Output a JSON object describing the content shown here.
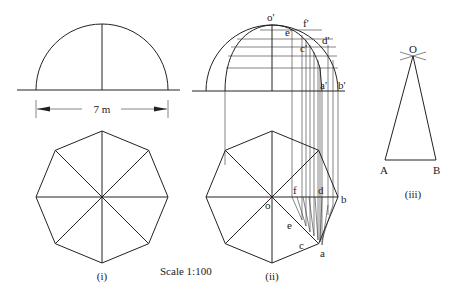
{
  "figures": [
    {
      "id": "i",
      "caption": "(i)",
      "dimension": "7 m",
      "description": "Elevation (semicircle) and plan (regular octagon) of hemispherical dome"
    },
    {
      "id": "ii",
      "caption": "(ii)",
      "elevation_labels": [
        "o'",
        "e'",
        "f'",
        "c'",
        "d'",
        "a'",
        "b'"
      ],
      "plan_labels": [
        "o",
        "f",
        "d",
        "b",
        "e",
        "c",
        "a"
      ]
    },
    {
      "id": "iii",
      "caption": "(iii)",
      "apex_label": "O",
      "base_labels": [
        "A",
        "B"
      ]
    }
  ],
  "scale_text": "Scale 1:100",
  "labels": {
    "dim": "7 m",
    "cap_i": "(i)",
    "cap_ii": "(ii)",
    "cap_iii": "(iii)",
    "scale": "Scale 1:100",
    "o_p": "o'",
    "e_p": "e'",
    "f_p": "f'",
    "c_p": "c'",
    "d_p": "d'",
    "a_p": "a'",
    "b_p": "b'",
    "o": "o",
    "f": "f",
    "d": "d",
    "b": "b",
    "e": "e",
    "c": "c",
    "a": "a",
    "O": "O",
    "A": "A",
    "B": "B"
  }
}
